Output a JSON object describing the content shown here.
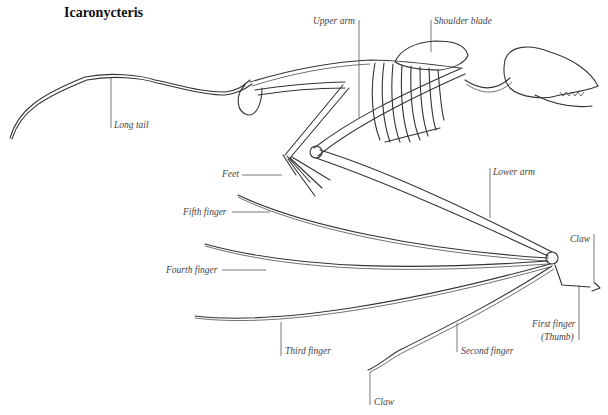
{
  "title": "Icaronycteris",
  "labels": {
    "upper_arm": "Upper arm",
    "shoulder_blade": "Shoulder blade",
    "long_tail": "Long tail",
    "feet": "Feet",
    "lower_arm": "Lower arm",
    "fifth_finger": "Fifth finger",
    "fourth_finger": "Fourth finger",
    "third_finger": "Third finger",
    "second_finger": "Second finger",
    "first_finger": "First finger",
    "thumb": "(Thumb)",
    "claw_top": "Claw",
    "claw_bottom": "Claw"
  }
}
